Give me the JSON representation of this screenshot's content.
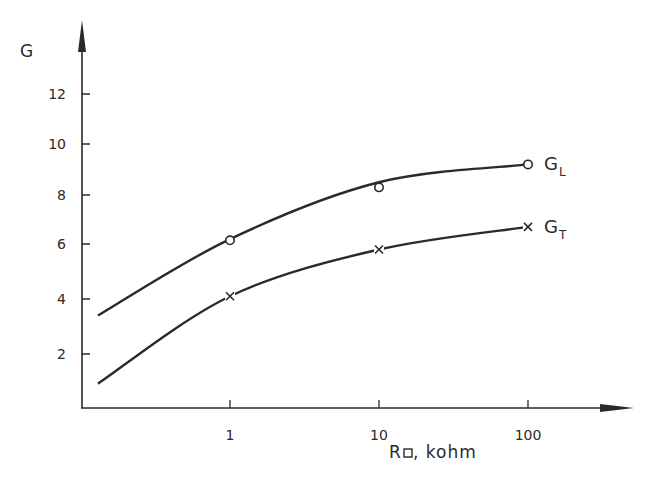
{
  "chart_data": {
    "type": "line",
    "title": "",
    "xlabel": "R□, kohm",
    "xlabel_main": "R",
    "xlabel_sub": "□",
    "xlabel_unit": ", kohm",
    "ylabel": "G",
    "x_scale": "log",
    "x_ticks": [
      1,
      10,
      100
    ],
    "x_tick_labels": [
      "1",
      "10",
      "100"
    ],
    "y_ticks": [
      2,
      4,
      6,
      8,
      10,
      12
    ],
    "y_tick_labels": [
      "2",
      "4",
      "6",
      "8",
      "10",
      "12"
    ],
    "xlim": [
      0.1,
      1000
    ],
    "ylim": [
      0,
      14
    ],
    "grid": false,
    "legend": "inline labels at right end of curves",
    "series": [
      {
        "name": "G_L",
        "label_main": "G",
        "label_sub": "L",
        "marker": "circle",
        "points": [
          {
            "x": 1,
            "y": 6.15
          },
          {
            "x": 10,
            "y": 8.3
          },
          {
            "x": 100,
            "y": 9.2
          }
        ],
        "curve": [
          {
            "x": 0.13,
            "y": 3.4
          },
          {
            "x": 1,
            "y": 6.2
          },
          {
            "x": 10,
            "y": 8.5
          },
          {
            "x": 100,
            "y": 9.2
          }
        ]
      },
      {
        "name": "G_T",
        "label_main": "G",
        "label_sub": "T",
        "marker": "cross",
        "points": [
          {
            "x": 1,
            "y": 4.1
          },
          {
            "x": 10,
            "y": 5.8
          },
          {
            "x": 100,
            "y": 6.7
          }
        ],
        "curve": [
          {
            "x": 0.13,
            "y": 0.9
          },
          {
            "x": 1,
            "y": 4.1
          },
          {
            "x": 10,
            "y": 5.8
          },
          {
            "x": 100,
            "y": 6.7
          }
        ]
      }
    ]
  }
}
